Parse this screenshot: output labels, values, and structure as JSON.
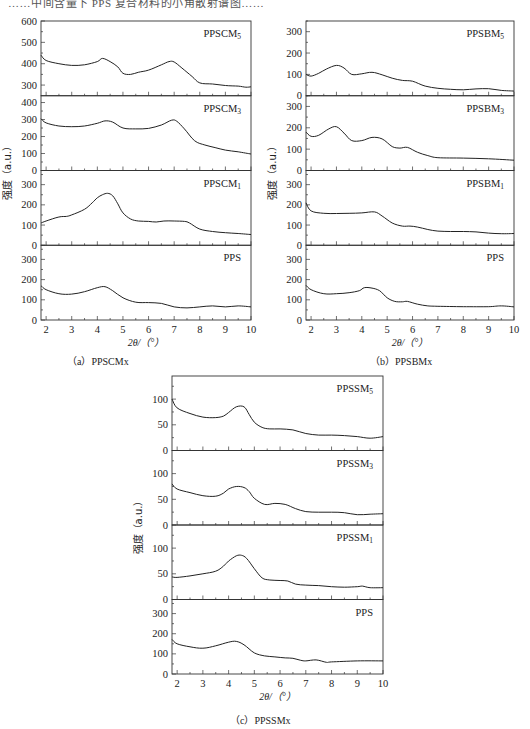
{
  "header_fragment": "……中间含量下 PPS 复合材料的小角散射谱图……",
  "figure": {
    "x_label": "2θ/（°）",
    "y_label": "强度（a.u.）",
    "x_ticks": [
      2,
      3,
      4,
      5,
      6,
      7,
      8,
      9,
      10
    ],
    "captions": {
      "a": "（a）PPSCMx",
      "b": "（b）PPSBMx",
      "c": "（c）PPSSMx"
    }
  },
  "chart_data": [
    {
      "id": "a",
      "type": "line",
      "title": "(a) PPSCMx",
      "xlabel": "2θ/(°)",
      "ylabel": "强度 (a.u.)",
      "xlim": [
        1.8,
        10
      ],
      "panels": [
        {
          "name": "PPSCM5",
          "label_main": "PPSCM",
          "label_sub": "5",
          "ylim": [
            250,
            600
          ],
          "yticks": [
            300,
            400,
            500,
            600
          ],
          "x": [
            1.8,
            2.0,
            2.5,
            3.0,
            3.5,
            4.0,
            4.2,
            4.5,
            4.8,
            5.0,
            5.3,
            5.6,
            6.0,
            6.5,
            6.8,
            7.0,
            7.3,
            7.7,
            8.0,
            8.5,
            9.0,
            9.5,
            9.8,
            10.0
          ],
          "y": [
            440,
            415,
            400,
            392,
            395,
            410,
            425,
            410,
            385,
            355,
            350,
            360,
            370,
            395,
            410,
            408,
            380,
            340,
            310,
            305,
            298,
            295,
            290,
            292
          ]
        },
        {
          "name": "PPSCM3",
          "label_main": "PPSCM",
          "label_sub": "3",
          "ylim": [
            0,
            440
          ],
          "yticks": [
            0,
            100,
            200,
            300,
            400
          ],
          "x": [
            1.8,
            2.0,
            2.5,
            3.0,
            3.5,
            4.0,
            4.3,
            4.6,
            5.0,
            5.5,
            6.0,
            6.5,
            6.9,
            7.1,
            7.4,
            7.8,
            8.2,
            8.6,
            9.0,
            9.5,
            10.0
          ],
          "y": [
            305,
            280,
            262,
            258,
            262,
            278,
            292,
            285,
            250,
            245,
            248,
            268,
            296,
            290,
            245,
            175,
            150,
            135,
            120,
            110,
            97
          ]
        },
        {
          "name": "PPSCM1",
          "label_main": "PPSCM",
          "label_sub": "1",
          "ylim": [
            0,
            370
          ],
          "yticks": [
            0,
            100,
            200,
            300
          ],
          "x": [
            1.8,
            2.0,
            2.5,
            2.8,
            3.0,
            3.5,
            3.8,
            4.0,
            4.2,
            4.4,
            4.6,
            4.8,
            5.0,
            5.3,
            5.6,
            6.0,
            6.3,
            6.6,
            7.0,
            7.4,
            7.6,
            8.0,
            8.5,
            9.0,
            9.5,
            10.0
          ],
          "y": [
            110,
            120,
            140,
            143,
            150,
            178,
            210,
            235,
            250,
            257,
            245,
            205,
            160,
            130,
            120,
            118,
            115,
            120,
            120,
            118,
            110,
            80,
            68,
            62,
            58,
            53
          ]
        },
        {
          "name": "PPS",
          "label_main": "PPS",
          "label_sub": "",
          "ylim": [
            0,
            370
          ],
          "yticks": [
            0,
            100,
            200,
            300
          ],
          "x": [
            1.8,
            2.0,
            2.5,
            3.0,
            3.5,
            4.0,
            4.3,
            4.6,
            5.0,
            5.5,
            6.0,
            6.5,
            7.0,
            7.5,
            8.0,
            8.5,
            9.0,
            9.5,
            10.0
          ],
          "y": [
            170,
            150,
            130,
            128,
            140,
            160,
            165,
            145,
            110,
            88,
            86,
            82,
            65,
            60,
            65,
            70,
            65,
            70,
            65
          ]
        }
      ]
    },
    {
      "id": "b",
      "type": "line",
      "title": "(b) PPSBMx",
      "xlabel": "2θ/(°)",
      "ylabel": "强度 (a.u.)",
      "xlim": [
        1.8,
        10
      ],
      "panels": [
        {
          "name": "PPSBM5",
          "label_main": "PPSBM",
          "label_sub": "5",
          "ylim": [
            0,
            350
          ],
          "yticks": [
            0,
            100,
            200,
            300
          ],
          "x": [
            1.8,
            2.0,
            2.3,
            2.6,
            3.0,
            3.3,
            3.6,
            4.0,
            4.4,
            4.8,
            5.2,
            5.6,
            6.0,
            6.5,
            7.0,
            7.5,
            8.0,
            8.5,
            9.0,
            9.5,
            10.0
          ],
          "y": [
            100,
            92,
            105,
            125,
            142,
            130,
            100,
            103,
            110,
            98,
            82,
            72,
            68,
            45,
            35,
            30,
            28,
            32,
            33,
            25,
            22
          ]
        },
        {
          "name": "PPSBM3",
          "label_main": "PPSBM",
          "label_sub": "3",
          "ylim": [
            0,
            350
          ],
          "yticks": [
            0,
            100,
            200,
            300
          ],
          "x": [
            1.8,
            2.0,
            2.3,
            2.7,
            3.0,
            3.3,
            3.6,
            4.0,
            4.4,
            4.8,
            5.2,
            5.5,
            5.8,
            6.2,
            6.6,
            7.0,
            8.0,
            9.0,
            10.0
          ],
          "y": [
            180,
            160,
            165,
            195,
            205,
            175,
            140,
            140,
            155,
            148,
            112,
            105,
            108,
            85,
            70,
            60,
            58,
            55,
            48
          ]
        },
        {
          "name": "PPSBM1",
          "label_main": "PPSBM",
          "label_sub": "1",
          "ylim": [
            0,
            370
          ],
          "yticks": [
            0,
            100,
            200,
            300
          ],
          "x": [
            1.8,
            2.0,
            2.5,
            3.0,
            3.5,
            4.0,
            4.5,
            4.8,
            5.2,
            5.6,
            5.9,
            6.2,
            6.6,
            7.0,
            7.5,
            8.0,
            8.5,
            9.0,
            9.5,
            10.0
          ],
          "y": [
            210,
            170,
            158,
            157,
            158,
            160,
            165,
            145,
            110,
            95,
            95,
            90,
            78,
            70,
            68,
            68,
            66,
            60,
            57,
            58
          ]
        },
        {
          "name": "PPS",
          "label_main": "PPS",
          "label_sub": "",
          "ylim": [
            0,
            370
          ],
          "yticks": [
            0,
            100,
            200,
            300
          ],
          "x": [
            1.8,
            2.0,
            2.5,
            3.0,
            3.5,
            3.9,
            4.1,
            4.4,
            4.7,
            5.0,
            5.3,
            5.6,
            5.8,
            6.2,
            6.6,
            7.0,
            8.0,
            9.0,
            9.5,
            10.0
          ],
          "y": [
            172,
            150,
            130,
            130,
            135,
            145,
            160,
            158,
            145,
            110,
            92,
            90,
            92,
            78,
            70,
            68,
            66,
            66,
            70,
            65
          ]
        }
      ]
    },
    {
      "id": "c",
      "type": "line",
      "title": "(c) PPSSMx",
      "xlabel": "2θ/(°)",
      "ylabel": "强度 (a.u.)",
      "xlim": [
        1.8,
        10
      ],
      "panels": [
        {
          "name": "PPSSM5",
          "label_main": "PPSSM",
          "label_sub": "5",
          "ylim": [
            0,
            145
          ],
          "yticks": [
            0,
            50,
            100
          ],
          "x": [
            1.8,
            2.0,
            2.5,
            3.0,
            3.5,
            3.8,
            4.0,
            4.3,
            4.6,
            4.8,
            5.0,
            5.3,
            5.6,
            6.0,
            6.5,
            7.0,
            7.5,
            8.0,
            8.5,
            9.0,
            9.5,
            10.0
          ],
          "y": [
            100,
            83,
            72,
            65,
            64,
            67,
            74,
            85,
            85,
            70,
            55,
            45,
            42,
            42,
            40,
            33,
            30,
            30,
            29,
            27,
            24,
            27
          ]
        },
        {
          "name": "PPSSM3",
          "label_main": "PPSSM",
          "label_sub": "3",
          "ylim": [
            0,
            145
          ],
          "yticks": [
            0,
            50,
            100
          ],
          "x": [
            1.8,
            2.0,
            2.5,
            3.0,
            3.5,
            3.8,
            4.0,
            4.3,
            4.6,
            4.8,
            5.0,
            5.4,
            5.8,
            6.2,
            6.6,
            7.0,
            7.5,
            8.0,
            8.5,
            9.0,
            9.5,
            10.0
          ],
          "y": [
            80,
            70,
            63,
            57,
            56,
            62,
            70,
            75,
            73,
            65,
            52,
            40,
            42,
            40,
            32,
            26,
            25,
            25,
            24,
            20,
            21,
            22
          ]
        },
        {
          "name": "PPSSM1",
          "label_main": "PPSSM",
          "label_sub": "1",
          "ylim": [
            0,
            145
          ],
          "yticks": [
            0,
            50,
            100
          ],
          "x": [
            1.8,
            2.0,
            2.5,
            3.0,
            3.5,
            3.8,
            4.0,
            4.3,
            4.5,
            4.7,
            5.0,
            5.3,
            5.6,
            6.0,
            6.3,
            6.6,
            7.0,
            7.5,
            8.0,
            8.5,
            9.0,
            9.2,
            9.5,
            10.0
          ],
          "y": [
            44,
            43,
            46,
            50,
            55,
            65,
            75,
            85,
            86,
            80,
            60,
            42,
            38,
            37,
            36,
            30,
            28,
            27,
            25,
            24,
            25,
            26,
            23,
            23
          ]
        },
        {
          "name": "PPS",
          "label_main": "PPS",
          "label_sub": "",
          "ylim": [
            0,
            370
          ],
          "yticks": [
            0,
            100,
            200,
            300
          ],
          "x": [
            1.8,
            2.0,
            2.5,
            3.0,
            3.5,
            4.0,
            4.3,
            4.6,
            5.0,
            5.4,
            5.8,
            6.2,
            6.5,
            6.8,
            7.0,
            7.4,
            7.8,
            8.0,
            9.0,
            10.0
          ],
          "y": [
            172,
            150,
            135,
            128,
            140,
            158,
            162,
            145,
            105,
            90,
            85,
            80,
            78,
            68,
            65,
            70,
            58,
            60,
            65,
            65
          ]
        }
      ]
    }
  ]
}
